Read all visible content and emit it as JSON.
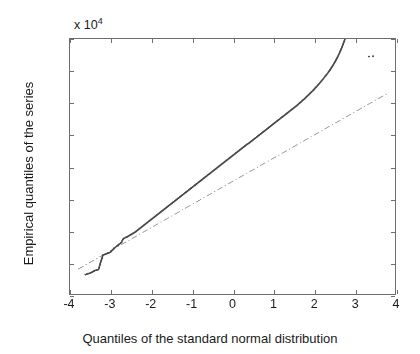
{
  "chart_data": {
    "type": "scatter",
    "title": "",
    "xlabel": "Quantiles of the standard normal distribution",
    "ylabel": "Empirical quantiles of the series",
    "y_exponent_label": "x 10",
    "y_exponent_power": "4",
    "y_scale_factor": 10000,
    "xlim": [
      -4,
      4
    ],
    "ylim": [
      1.8,
      2.6
    ],
    "xticks": [
      -4,
      -3,
      -2,
      -1,
      0,
      1,
      2,
      3,
      4
    ],
    "xtick_labels": [
      "-4",
      "-3",
      "-2",
      "-1",
      "0",
      "1",
      "2",
      "3",
      "4"
    ],
    "yticks": [
      1.8,
      1.9,
      2.0,
      2.1,
      2.2,
      2.3,
      2.4,
      2.5,
      2.6
    ],
    "ytick_labels": [
      "1.8",
      "1.9",
      "2",
      "2.1",
      "2.2",
      "2.3",
      "2.4",
      "2.5",
      "2.6"
    ],
    "grid": false,
    "legend": null,
    "marker_color": "#4a4a4a",
    "marker_size": 1.9,
    "reference_line_color": "#9a9a9a",
    "reference_line_style": "dash-dot",
    "axis_color": "#6e6e6e",
    "background_color": "#ffffff",
    "reference_line": {
      "x": [
        -3.8,
        3.85
      ],
      "y": [
        1.878,
        2.432
      ]
    },
    "series": [
      {
        "name": "empirical quantiles",
        "points": [
          [
            -3.62,
            1.861
          ],
          [
            -3.5,
            1.866
          ],
          [
            -3.38,
            1.874
          ],
          [
            -3.3,
            1.877
          ],
          [
            -3.19,
            1.922
          ],
          [
            -3.15,
            1.924
          ],
          [
            -3.11,
            1.926
          ],
          [
            -3.07,
            1.928
          ],
          [
            -3.03,
            1.93
          ],
          [
            -3.0,
            1.932
          ],
          [
            -2.97,
            1.936
          ],
          [
            -2.94,
            1.94
          ],
          [
            -2.91,
            1.944
          ],
          [
            -2.88,
            1.947
          ],
          [
            -2.85,
            1.95
          ],
          [
            -2.82,
            1.953
          ],
          [
            -2.79,
            1.956
          ],
          [
            -2.76,
            1.959
          ],
          [
            -2.73,
            1.963
          ],
          [
            -2.7,
            1.971
          ],
          [
            -2.67,
            1.975
          ],
          [
            -2.64,
            1.977
          ],
          [
            -2.6,
            1.979
          ],
          [
            -2.56,
            1.982
          ],
          [
            -2.52,
            1.985
          ],
          [
            -2.48,
            1.988
          ],
          [
            -2.44,
            1.991
          ],
          [
            -2.4,
            1.994
          ],
          [
            -2.36,
            1.998
          ],
          [
            -2.32,
            2.002
          ],
          [
            -2.28,
            2.006
          ],
          [
            -2.24,
            2.01
          ],
          [
            -2.2,
            2.014
          ],
          [
            -2.16,
            2.018
          ],
          [
            -2.12,
            2.022
          ],
          [
            -2.08,
            2.026
          ],
          [
            -2.04,
            2.03
          ],
          [
            -2.0,
            2.034
          ],
          [
            -1.96,
            2.038
          ],
          [
            -1.92,
            2.042
          ],
          [
            -1.88,
            2.046
          ],
          [
            -1.84,
            2.05
          ],
          [
            -1.8,
            2.054
          ],
          [
            -1.76,
            2.058
          ],
          [
            -1.72,
            2.062
          ],
          [
            -1.68,
            2.066
          ],
          [
            -1.64,
            2.07
          ],
          [
            -1.6,
            2.074
          ],
          [
            -1.56,
            2.078
          ],
          [
            -1.52,
            2.082
          ],
          [
            -1.48,
            2.086
          ],
          [
            -1.44,
            2.09
          ],
          [
            -1.4,
            2.094
          ],
          [
            -1.36,
            2.098
          ],
          [
            -1.32,
            2.102
          ],
          [
            -1.28,
            2.106
          ],
          [
            -1.24,
            2.11
          ],
          [
            -1.2,
            2.114
          ],
          [
            -1.16,
            2.118
          ],
          [
            -1.12,
            2.122
          ],
          [
            -1.08,
            2.126
          ],
          [
            -1.04,
            2.13
          ],
          [
            -1.0,
            2.134
          ],
          [
            -0.96,
            2.138
          ],
          [
            -0.92,
            2.142
          ],
          [
            -0.88,
            2.146
          ],
          [
            -0.84,
            2.15
          ],
          [
            -0.8,
            2.154
          ],
          [
            -0.76,
            2.158
          ],
          [
            -0.72,
            2.162
          ],
          [
            -0.68,
            2.166
          ],
          [
            -0.64,
            2.17
          ],
          [
            -0.6,
            2.174
          ],
          [
            -0.56,
            2.178
          ],
          [
            -0.52,
            2.182
          ],
          [
            -0.48,
            2.186
          ],
          [
            -0.44,
            2.19
          ],
          [
            -0.4,
            2.194
          ],
          [
            -0.36,
            2.198
          ],
          [
            -0.32,
            2.202
          ],
          [
            -0.28,
            2.206
          ],
          [
            -0.24,
            2.21
          ],
          [
            -0.2,
            2.214
          ],
          [
            -0.16,
            2.218
          ],
          [
            -0.12,
            2.222
          ],
          [
            -0.08,
            2.226
          ],
          [
            -0.04,
            2.23
          ],
          [
            0.0,
            2.234
          ],
          [
            0.04,
            2.238
          ],
          [
            0.08,
            2.242
          ],
          [
            0.12,
            2.246
          ],
          [
            0.16,
            2.25
          ],
          [
            0.2,
            2.254
          ],
          [
            0.24,
            2.258
          ],
          [
            0.28,
            2.262
          ],
          [
            0.32,
            2.266
          ],
          [
            0.36,
            2.27
          ],
          [
            0.4,
            2.273
          ],
          [
            0.44,
            2.277
          ],
          [
            0.48,
            2.281
          ],
          [
            0.52,
            2.285
          ],
          [
            0.56,
            2.289
          ],
          [
            0.6,
            2.293
          ],
          [
            0.64,
            2.297
          ],
          [
            0.68,
            2.301
          ],
          [
            0.72,
            2.305
          ],
          [
            0.76,
            2.309
          ],
          [
            0.8,
            2.313
          ],
          [
            0.84,
            2.317
          ],
          [
            0.88,
            2.321
          ],
          [
            0.92,
            2.325
          ],
          [
            0.96,
            2.329
          ],
          [
            1.0,
            2.333
          ],
          [
            1.04,
            2.337
          ],
          [
            1.08,
            2.341
          ],
          [
            1.12,
            2.345
          ],
          [
            1.16,
            2.349
          ],
          [
            1.2,
            2.353
          ],
          [
            1.24,
            2.357
          ],
          [
            1.28,
            2.361
          ],
          [
            1.32,
            2.365
          ],
          [
            1.36,
            2.369
          ],
          [
            1.4,
            2.373
          ],
          [
            1.44,
            2.377
          ],
          [
            1.48,
            2.381
          ],
          [
            1.52,
            2.385
          ],
          [
            1.56,
            2.389
          ],
          [
            1.6,
            2.393
          ],
          [
            1.64,
            2.398
          ],
          [
            1.68,
            2.402
          ],
          [
            1.72,
            2.407
          ],
          [
            1.76,
            2.411
          ],
          [
            1.8,
            2.416
          ],
          [
            1.84,
            2.421
          ],
          [
            1.88,
            2.426
          ],
          [
            1.92,
            2.431
          ],
          [
            1.96,
            2.436
          ],
          [
            2.0,
            2.441
          ],
          [
            2.04,
            2.447
          ],
          [
            2.08,
            2.452
          ],
          [
            2.12,
            2.458
          ],
          [
            2.16,
            2.464
          ],
          [
            2.2,
            2.47
          ],
          [
            2.24,
            2.476
          ],
          [
            2.28,
            2.483
          ],
          [
            2.32,
            2.489
          ],
          [
            2.36,
            2.496
          ],
          [
            2.4,
            2.503
          ],
          [
            2.44,
            2.511
          ],
          [
            2.48,
            2.519
          ],
          [
            2.52,
            2.528
          ],
          [
            2.56,
            2.537
          ],
          [
            2.6,
            2.547
          ],
          [
            2.64,
            2.558
          ],
          [
            2.68,
            2.57
          ],
          [
            2.72,
            2.583
          ],
          [
            2.76,
            2.597
          ],
          [
            2.8,
            2.612
          ],
          [
            2.84,
            2.628
          ],
          [
            2.88,
            2.645
          ],
          [
            2.92,
            2.663
          ],
          [
            2.96,
            2.683
          ],
          [
            3.0,
            2.705
          ],
          [
            3.04,
            2.728
          ],
          [
            3.08,
            2.752
          ],
          [
            3.12,
            2.778
          ],
          [
            3.16,
            2.805
          ],
          [
            3.2,
            2.833
          ],
          [
            3.24,
            2.862
          ],
          [
            3.28,
            2.88
          ],
          [
            3.31,
            2.888
          ]
        ]
      },
      {
        "name": "upper outliers",
        "points": [
          [
            3.36,
            2.545
          ],
          [
            3.46,
            2.546
          ]
        ]
      }
    ]
  }
}
